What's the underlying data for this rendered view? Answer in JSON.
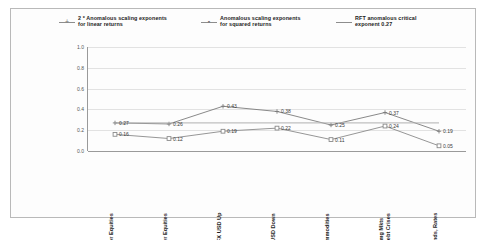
{
  "chart_data": {
    "type": "line",
    "title": "",
    "xlabel": "",
    "ylabel": "",
    "ylim": [
      0.0,
      1.0
    ],
    "yticks": [
      "1.0",
      "0.8",
      "0.6",
      "0.4",
      "0.2",
      "0.0"
    ],
    "ytick_values": [
      1.0,
      0.8,
      0.6,
      0.4,
      0.2,
      0.0
    ],
    "grid": true,
    "legend_position": "top",
    "categories": [
      "Major Equities",
      "Other Equities",
      "FX USD Up",
      "FX USD Down",
      "Commodities",
      "Emg Mkts\nDebt Crises",
      "Bonds, Rates"
    ],
    "series": [
      {
        "name": "2 * Anomalous scaling exponents\nfor linear returns",
        "marker": "cross",
        "color": "#7c7c7c",
        "values": [
          0.27,
          0.26,
          0.43,
          0.38,
          0.25,
          0.37,
          0.19
        ],
        "labels": [
          "0.27",
          "0.26",
          "0.43",
          "0.38",
          "0.25",
          "0.37",
          "0.19"
        ]
      },
      {
        "name": "Anomalous scaling exponents\nfor squared returns",
        "marker": "square",
        "color": "#8a8a8a",
        "values": [
          0.16,
          0.12,
          0.19,
          0.22,
          0.11,
          0.24,
          0.05
        ],
        "labels": [
          "0.16",
          "0.12",
          "0.19",
          "0.22",
          "0.11",
          "0.24",
          "0.05"
        ]
      },
      {
        "name": "RFT anomalous critical\nexponent 0.27",
        "marker": "none",
        "color": "#b0b0b0",
        "constant": 0.27,
        "values": [
          0.27,
          0.27,
          0.27,
          0.27,
          0.27,
          0.27,
          0.27
        ],
        "labels": []
      }
    ]
  },
  "legend": {
    "items": [
      {
        "label": "2 * Anomalous scaling exponents\nfor linear returns",
        "marker": "cross"
      },
      {
        "label": "Anomalous scaling exponents\nfor squared returns",
        "marker": "square"
      },
      {
        "label": "RFT anomalous critical\nexponent 0.27",
        "marker": "none"
      }
    ]
  }
}
